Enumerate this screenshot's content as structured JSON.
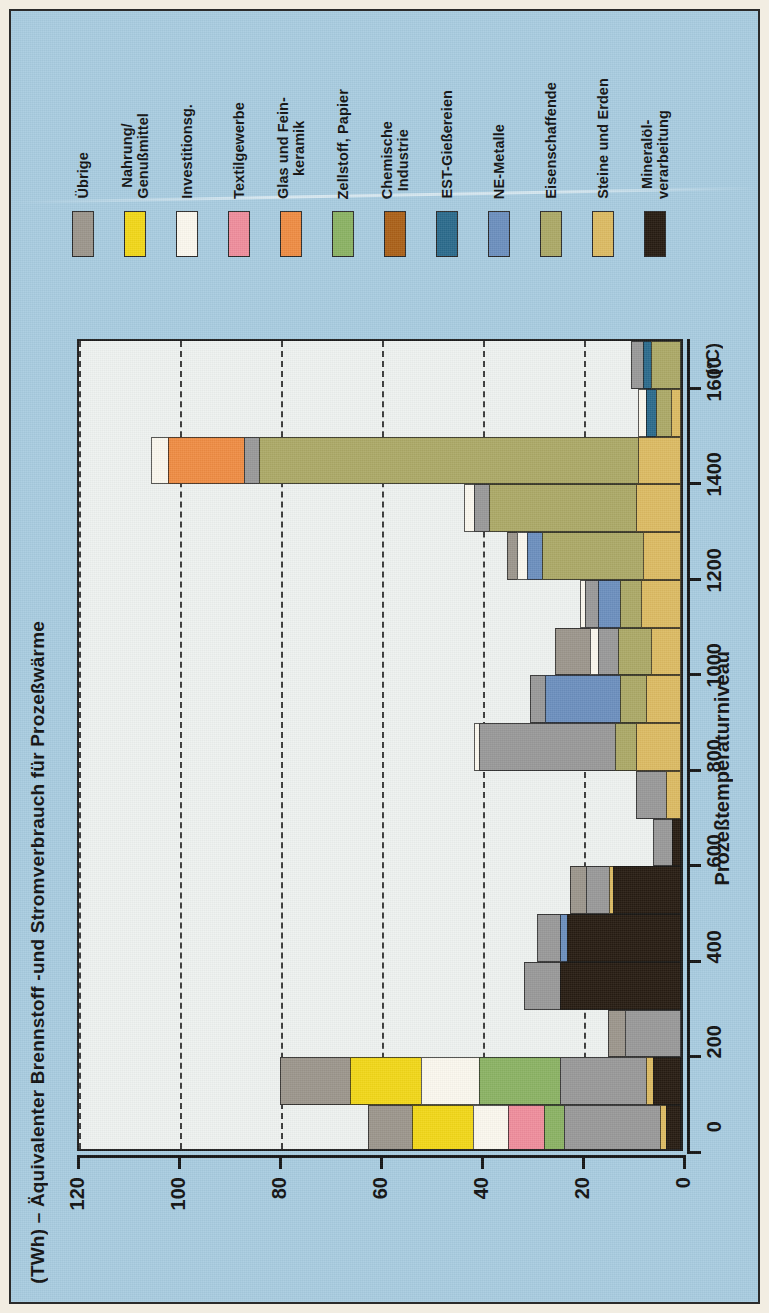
{
  "figure": {
    "background_color": "#a8cce0",
    "plot_background_color": "#eef2f0",
    "border_color": "#1d1d1d"
  },
  "titles": {
    "value_axis_title": "(TWh) – Äquivalenter Brennstoff -und Stromverbrauch für Prozeßwärme",
    "category_axis_title": "Prozeßtemperaturniveau",
    "category_axis_unit": "(°C)"
  },
  "legend": {
    "items": [
      {
        "label": "Übrige",
        "color": "#9c968c"
      },
      {
        "label": "Nahrung/\nGenußmittel",
        "color": "#f2d718"
      },
      {
        "label": "Investitionsg.",
        "color": "#fbf8ee"
      },
      {
        "label": "Textilgewerbe",
        "color": "#ef8d9c"
      },
      {
        "label": "Glas und Fein-\nkeramik",
        "color": "#ef8c43"
      },
      {
        "label": "Zellstoff, Papier",
        "color": "#8bb364"
      },
      {
        "label": "Chemische\nIndustrie",
        "color": "#ab6118"
      },
      {
        "label": "EST-Gießereien",
        "color": "#2b6b8c"
      },
      {
        "label": "NE-Metalle",
        "color": "#6c8fbe"
      },
      {
        "label": "Eisenschaffende",
        "color": "#aca967"
      },
      {
        "label": "Steine und Erden",
        "color": "#dcbb63"
      },
      {
        "label": "Mineralöl-\nverarbeitung",
        "color": "#271c12"
      }
    ]
  },
  "chart_data": {
    "type": "bar",
    "orientation": "horizontal",
    "stacked": true,
    "title": "(TWh) – Äquivalenter Brennstoff -und Stromverbrauch für Prozeßwärme",
    "xlabel": "Prozeßtemperaturniveau",
    "ylabel": "(TWh) – Äquivalenter Brennstoff -und Stromverbrauch für Prozeßwärme",
    "xlim": [
      0,
      1700
    ],
    "ylim": [
      0,
      120
    ],
    "x_ticks": [
      0,
      200,
      400,
      600,
      800,
      1000,
      1200,
      1400,
      1600
    ],
    "y_ticks": [
      0,
      20,
      40,
      60,
      80,
      100,
      120
    ],
    "x_tick_labels": [
      "0",
      "200",
      "400",
      "600",
      "800",
      "1000",
      "1200",
      "1400",
      "1600"
    ],
    "y_tick_labels": [
      "0",
      "20",
      "40",
      "60",
      "80",
      "100",
      "120"
    ],
    "grid": "dashed vertical gridlines at value ticks",
    "legend_position": "top",
    "series_order": [
      "Mineralöl-verarbeitung",
      "Steine und Erden",
      "Eisenschaffende",
      "NE-Metalle",
      "EST-Gießereien",
      "Chemische Industrie",
      "Zellstoff, Papier",
      "Glas und Feinkeramik",
      "Textilgewerbe",
      "Investitionsg.",
      "Nahrung/Genußmittel",
      "Übrige"
    ],
    "categories": [
      50,
      150,
      250,
      350,
      450,
      550,
      650,
      750,
      850,
      950,
      1050,
      1150,
      1250,
      1350,
      1450,
      1550,
      1650
    ],
    "bars": [
      {
        "temp": 50,
        "total": 62.0,
        "segments": [
          {
            "name": "Mineralöl-verarbeitung",
            "value": 3.0
          },
          {
            "name": "Steine und Erden",
            "value": 1.2
          },
          {
            "name": "Chemische Industrie",
            "value": 19.0
          },
          {
            "name": "Zellstoff, Papier",
            "value": 4.0
          },
          {
            "name": "Textilgewerbe",
            "value": 7.0
          },
          {
            "name": "Investitionsg.",
            "value": 7.0
          },
          {
            "name": "Nahrung/Genußmittel",
            "value": 12.0
          },
          {
            "name": "Übrige",
            "value": 8.8
          }
        ]
      },
      {
        "temp": 150,
        "total": 79.5,
        "segments": [
          {
            "name": "Mineralöl-verarbeitung",
            "value": 5.5
          },
          {
            "name": "Steine und Erden",
            "value": 1.5
          },
          {
            "name": "Chemische Industrie",
            "value": 17.0
          },
          {
            "name": "Zellstoff, Papier",
            "value": 16.0
          },
          {
            "name": "Investitionsg.",
            "value": 11.5
          },
          {
            "name": "Nahrung/Genußmittel",
            "value": 14.0
          },
          {
            "name": "Übrige",
            "value": 14.0
          }
        ]
      },
      {
        "temp": 250,
        "total": 14.5,
        "segments": [
          {
            "name": "Chemische Industrie",
            "value": 11.0
          },
          {
            "name": "Übrige",
            "value": 3.5
          }
        ]
      },
      {
        "temp": 350,
        "total": 31.0,
        "segments": [
          {
            "name": "Mineralöl-verarbeitung",
            "value": 24.0
          },
          {
            "name": "Chemische Industrie",
            "value": 7.0
          }
        ]
      },
      {
        "temp": 450,
        "total": 28.5,
        "segments": [
          {
            "name": "Mineralöl-verarbeitung",
            "value": 22.5
          },
          {
            "name": "NE-Metalle",
            "value": 1.5
          },
          {
            "name": "Chemische Industrie",
            "value": 4.5
          }
        ]
      },
      {
        "temp": 550,
        "total": 22.0,
        "segments": [
          {
            "name": "Mineralöl-verarbeitung",
            "value": 13.5
          },
          {
            "name": "Steine und Erden",
            "value": 0.8
          },
          {
            "name": "Chemische Industrie",
            "value": 4.5
          },
          {
            "name": "Übrige",
            "value": 3.2
          }
        ]
      },
      {
        "temp": 650,
        "total": 5.5,
        "segments": [
          {
            "name": "Mineralöl-verarbeitung",
            "value": 1.8
          },
          {
            "name": "Chemische Industrie",
            "value": 3.7
          }
        ]
      },
      {
        "temp": 750,
        "total": 9.0,
        "segments": [
          {
            "name": "Steine und Erden",
            "value": 3.0
          },
          {
            "name": "Chemische Industrie",
            "value": 6.0
          }
        ]
      },
      {
        "temp": 850,
        "total": 41.0,
        "segments": [
          {
            "name": "Steine und Erden",
            "value": 9.0
          },
          {
            "name": "Eisenschaffende",
            "value": 4.0
          },
          {
            "name": "Chemische Industrie",
            "value": 27.0
          },
          {
            "name": "Investitionsg.",
            "value": 1.0
          }
        ]
      },
      {
        "temp": 950,
        "total": 30.0,
        "segments": [
          {
            "name": "Steine und Erden",
            "value": 7.0
          },
          {
            "name": "Eisenschaffende",
            "value": 5.0
          },
          {
            "name": "NE-Metalle",
            "value": 15.0
          },
          {
            "name": "Chemische Industrie",
            "value": 3.0
          }
        ]
      },
      {
        "temp": 1050,
        "total": 25.0,
        "segments": [
          {
            "name": "Steine und Erden",
            "value": 6.0
          },
          {
            "name": "Eisenschaffende",
            "value": 6.5
          },
          {
            "name": "Chemische Industrie",
            "value": 4.0
          },
          {
            "name": "Investitionsg.",
            "value": 1.5
          },
          {
            "name": "Übrige",
            "value": 7.0
          }
        ]
      },
      {
        "temp": 1150,
        "total": 20.0,
        "segments": [
          {
            "name": "Steine und Erden",
            "value": 8.0
          },
          {
            "name": "Eisenschaffende",
            "value": 4.0
          },
          {
            "name": "NE-Metalle",
            "value": 4.5
          },
          {
            "name": "Chemische Industrie",
            "value": 2.5
          },
          {
            "name": "Investitionsg.",
            "value": 1.0
          }
        ]
      },
      {
        "temp": 1250,
        "total": 34.5,
        "segments": [
          {
            "name": "Steine und Erden",
            "value": 7.5
          },
          {
            "name": "Eisenschaffende",
            "value": 20.0
          },
          {
            "name": "NE-Metalle",
            "value": 3.0
          },
          {
            "name": "Investitionsg.",
            "value": 2.0
          },
          {
            "name": "Übrige",
            "value": 2.0
          }
        ]
      },
      {
        "temp": 1350,
        "total": 43.0,
        "segments": [
          {
            "name": "Steine und Erden",
            "value": 9.0
          },
          {
            "name": "Eisenschaffende",
            "value": 29.0
          },
          {
            "name": "Chemische Industrie",
            "value": 3.0
          },
          {
            "name": "Investitionsg.",
            "value": 2.0
          }
        ]
      },
      {
        "temp": 1450,
        "total": 105.0,
        "segments": [
          {
            "name": "Steine und Erden",
            "value": 8.5
          },
          {
            "name": "Eisenschaffende",
            "value": 75.0
          },
          {
            "name": "Chemische Industrie",
            "value": 3.0
          },
          {
            "name": "Glas und Feinkeramik",
            "value": 15.0
          },
          {
            "name": "Investitionsg.",
            "value": 3.5
          }
        ]
      },
      {
        "temp": 1550,
        "total": 8.5,
        "segments": [
          {
            "name": "Steine und Erden",
            "value": 2.0
          },
          {
            "name": "Eisenschaffende",
            "value": 3.0
          },
          {
            "name": "EST-Gießereien",
            "value": 2.0
          },
          {
            "name": "Investitionsg.",
            "value": 1.5
          }
        ]
      },
      {
        "temp": 1650,
        "total": 10.0,
        "segments": [
          {
            "name": "Eisenschaffende",
            "value": 6.0
          },
          {
            "name": "EST-Gießereien",
            "value": 1.5
          },
          {
            "name": "Chemische Industrie",
            "value": 2.5
          }
        ]
      }
    ]
  }
}
